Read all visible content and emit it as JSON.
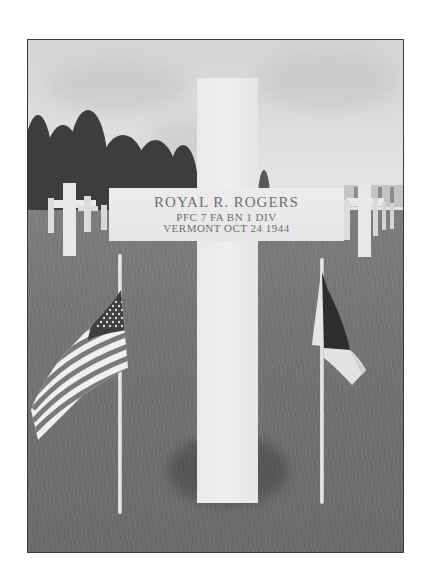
{
  "photo": {
    "description": "Black-and-white photograph of a white marble cross grave marker in a military cemetery, flanked by a small United States flag on the left and a small French tricolor flag on the right.",
    "style": "grayscale"
  },
  "headstone": {
    "name": "ROYAL R. ROGERS",
    "unit": "PFC  7 FA BN  1 DIV",
    "state_date": "VERMONT  OCT 24 1944"
  },
  "flags": {
    "left": "us-flag",
    "right": "french-flag"
  },
  "colors": {
    "frame_border": "#3a3a3a",
    "marble": "#ececec",
    "grass": "#747474",
    "trees": "#3d3d3d",
    "sky": "#dadada",
    "inscription": "#6e6e6e"
  }
}
